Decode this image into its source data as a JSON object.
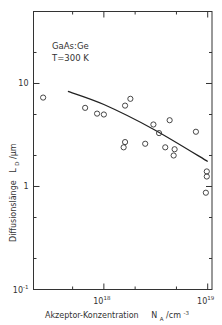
{
  "chart_data": {
    "type": "scatter",
    "title": "",
    "annotation": [
      "GaAs:Ge",
      "T=300 K"
    ],
    "xlabel": "Akzeptor-Konzentration",
    "xlabel_unit": {
      "symbol": "N",
      "sub": "A",
      "unit": "/cm",
      "unit_sup": "-3"
    },
    "ylabel": "Diffusionslänge",
    "ylabel_unit": {
      "symbol": "L",
      "sub": "D",
      "unit": "/μm"
    },
    "xscale": "log",
    "yscale": "log",
    "xlim": [
      2.1e+17,
      1.1e+19
    ],
    "ylim": [
      0.1,
      50
    ],
    "x_ticks": [
      {
        "value": 1e+18,
        "base": "10",
        "exp": "18"
      },
      {
        "value": 1e+19,
        "base": "10",
        "exp": "19"
      }
    ],
    "x_minor_ticks": [
      5e+17,
      2e+18,
      5e+18
    ],
    "y_ticks": [
      {
        "value": 0.1,
        "base": "10",
        "exp": "-1"
      },
      {
        "value": 1,
        "base": "1",
        "exp": ""
      },
      {
        "value": 10,
        "base": "10",
        "exp": ""
      }
    ],
    "y_minor_ticks": [
      0.2,
      0.5,
      2,
      5,
      20
    ],
    "grid": false,
    "series": [
      {
        "name": "Messwerte",
        "marker": "open-circle",
        "points": [
          [
            2.6e+17,
            7.3
          ],
          [
            6.6e+17,
            5.8
          ],
          [
            8.6e+17,
            5.1
          ],
          [
            1e+18,
            5.0
          ],
          [
            1.6e+18,
            6.1
          ],
          [
            1.8e+18,
            7.1
          ],
          [
            1.6e+18,
            2.7
          ],
          [
            1.55e+18,
            2.4
          ],
          [
            2.5e+18,
            2.6
          ],
          [
            3e+18,
            4.0
          ],
          [
            3.4e+18,
            3.3
          ],
          [
            4.3e+18,
            4.4
          ],
          [
            3.9e+18,
            2.4
          ],
          [
            4.8e+18,
            2.3
          ],
          [
            4.7e+18,
            2.0
          ],
          [
            7.7e+18,
            3.4
          ],
          [
            9.8e+18,
            1.4
          ],
          [
            9.8e+18,
            1.25
          ],
          [
            9.6e+18,
            0.87
          ]
        ]
      },
      {
        "name": "Theorie",
        "marker": "line",
        "points": [
          [
            4.5e+17,
            8.4
          ],
          [
            1e+18,
            6.25
          ],
          [
            3e+18,
            3.6
          ],
          [
            1e+19,
            1.75
          ]
        ]
      }
    ]
  }
}
